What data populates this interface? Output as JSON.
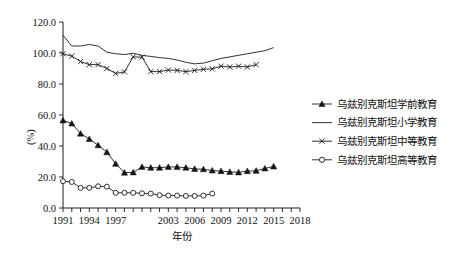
{
  "chart_data": {
    "type": "line",
    "title": "",
    "xlabel": "年份",
    "ylabel": "(%)",
    "xlim": [
      1991,
      2018
    ],
    "ylim": [
      0.0,
      120.0
    ],
    "yticks": [
      "0.0",
      "20.0",
      "40.0",
      "60.0",
      "80.0",
      "100.0",
      "120.0"
    ],
    "ytick_values": [
      0.0,
      20.0,
      40.0,
      60.0,
      80.0,
      100.0,
      120.0
    ],
    "xticks": [
      "1991",
      "1994",
      "1997",
      "2003",
      "2006",
      "2009",
      "2012",
      "2015",
      "2018"
    ],
    "xtick_values": [
      1991,
      1994,
      1997,
      2000,
      2003,
      2006,
      2009,
      2012,
      2015,
      2018
    ],
    "x": [
      1991,
      1992,
      1993,
      1994,
      1995,
      1996,
      1997,
      1998,
      1999,
      2000,
      2001,
      2002,
      2003,
      2004,
      2005,
      2006,
      2007,
      2008,
      2009,
      2010,
      2011,
      2012,
      2013,
      2014,
      2015,
      2016,
      2017,
      2018
    ],
    "grid": false,
    "legend_position": "right",
    "series": [
      {
        "name": "乌兹别克斯坦学前教育",
        "marker": "triangle",
        "values": [
          56.5,
          54.5,
          48.0,
          44.5,
          40.5,
          36.0,
          28.5,
          22.8,
          23.0,
          26.5,
          26.0,
          26.0,
          26.5,
          26.5,
          26.0,
          25.2,
          25.0,
          24.2,
          23.8,
          23.3,
          23.0,
          23.8,
          24.0,
          25.5,
          26.8,
          null,
          null,
          null
        ]
      },
      {
        "name": "乌兹别克斯坦小学教育",
        "marker": "none",
        "values": [
          111.5,
          104.5,
          104.5,
          105.5,
          104.5,
          100.5,
          99.5,
          99.0,
          99.8,
          98.5,
          97.8,
          97.0,
          96.5,
          95.5,
          94.0,
          93.0,
          93.5,
          95.0,
          96.5,
          97.5,
          98.5,
          99.5,
          100.5,
          101.5,
          103.5,
          null,
          null,
          null
        ]
      },
      {
        "name": "乌兹别克斯坦中等教育",
        "marker": "x",
        "values": [
          99.5,
          98.0,
          94.5,
          92.5,
          92.5,
          90.0,
          86.8,
          87.8,
          97.5,
          97.3,
          88.0,
          88.0,
          89.0,
          88.8,
          88.0,
          88.8,
          89.5,
          89.8,
          91.5,
          91.0,
          91.5,
          91.0,
          92.5,
          null,
          null,
          null,
          null,
          null
        ]
      },
      {
        "name": "乌兹别克斯坦高等教育",
        "marker": "circle",
        "values": [
          17.3,
          16.8,
          13.0,
          13.0,
          14.0,
          13.8,
          9.8,
          9.8,
          9.8,
          9.5,
          9.3,
          8.3,
          8.0,
          8.0,
          7.8,
          7.8,
          8.0,
          9.3,
          null,
          null,
          null,
          null,
          null,
          null,
          null,
          null,
          null,
          null
        ]
      }
    ]
  }
}
